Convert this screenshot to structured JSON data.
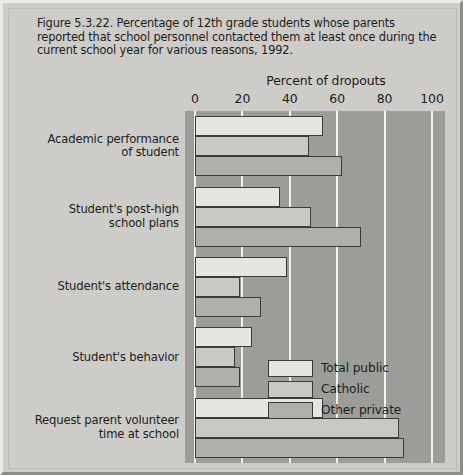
{
  "figure": {
    "caption": "Figure 5.3.22. Percentage of 12th grade students whose parents reported that school personnel contacted them at least once during the current school year for various reasons, 1992."
  },
  "legend": {
    "entries": [
      {
        "label": "Total public",
        "color": "#e6e5e1"
      },
      {
        "label": "Catholic",
        "color": "#c9c8c4"
      },
      {
        "label": "Other private",
        "color": "#b0afab"
      }
    ]
  },
  "chart_data": {
    "type": "bar",
    "orientation": "horizontal",
    "title": "",
    "xlabel": "Percent of dropouts",
    "ylabel": "",
    "xlim": [
      0,
      100
    ],
    "xticks": [
      0,
      20,
      40,
      60,
      80,
      100
    ],
    "xticklabels": [
      "0",
      "20",
      "40",
      "60",
      "80",
      "100"
    ],
    "grid": true,
    "grid_axis": "x",
    "legend_position": "center-right",
    "categories": [
      "Academic performance of student",
      "Student's post-high school plans",
      "Student's attendance",
      "Student's behavior",
      "Request parent volunteer time at school"
    ],
    "category_lines": [
      [
        "Academic performance",
        "of student"
      ],
      [
        "Student's post-high",
        "school plans"
      ],
      [
        "Student's attendance"
      ],
      [
        "Student's behavior"
      ],
      [
        "Request parent volunteer",
        "time at school"
      ]
    ],
    "series": [
      {
        "name": "Total public",
        "color": "#e6e5e1",
        "values": [
          54,
          36,
          39,
          24,
          54
        ]
      },
      {
        "name": "Catholic",
        "color": "#c9c8c4",
        "values": [
          48,
          49,
          19,
          17,
          86
        ]
      },
      {
        "name": "Other private",
        "color": "#b0afab",
        "values": [
          62,
          70,
          28,
          19,
          88
        ]
      }
    ],
    "plot_background": "#9c9c99",
    "gridline_color": "#f2f1ee"
  }
}
